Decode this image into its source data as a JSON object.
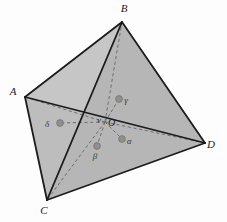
{
  "figure": {
    "canvas": {
      "width": 227,
      "height": 222,
      "background": "#fdfdfd"
    },
    "style": {
      "face_light": "#d2d2d2",
      "face_mid": "#c6c6c6",
      "face_dark": "#bdbdbd",
      "face_darkest": "#b6b6b6",
      "edge_color": "#1c1c1c",
      "dashed_color": "#6e6e6e",
      "marker_color": "#8f8f8f",
      "marker_stroke": "#707070",
      "label_color": "#1a1a1a"
    },
    "vertices": [
      {
        "id": "B",
        "label": "B",
        "x": 122,
        "y": 22,
        "label_x": 124,
        "label_y": 12,
        "role": "apex"
      },
      {
        "id": "A",
        "label": "A",
        "x": 25,
        "y": 97,
        "label_x": 13,
        "label_y": 95,
        "role": "left"
      },
      {
        "id": "C",
        "label": "C",
        "x": 47,
        "y": 200,
        "label_x": 44,
        "label_y": 214,
        "role": "bottom"
      },
      {
        "id": "D",
        "label": "D",
        "x": 205,
        "y": 143,
        "label_x": 211,
        "label_y": 148,
        "role": "right"
      }
    ],
    "interior_point": {
      "id": "O",
      "label": "O",
      "x": 105,
      "y": 122,
      "label_x": 108,
      "label_y": 126,
      "tick_label": "ν",
      "tick_label_x": 99,
      "tick_label_y": 123
    },
    "face_centers": [
      {
        "id": "alpha",
        "label": "α",
        "x": 122,
        "y": 139,
        "label_x": 129,
        "label_y": 144,
        "face": "OBCD"
      },
      {
        "id": "beta",
        "label": "β",
        "x": 97,
        "y": 146,
        "label_x": 95,
        "label_y": 159,
        "face": "OACD"
      },
      {
        "id": "gamma",
        "label": "γ",
        "x": 119,
        "y": 99,
        "label_x": 126,
        "label_y": 103,
        "face": "OABD"
      },
      {
        "id": "delta",
        "label": "δ",
        "x": 60,
        "y": 123,
        "label_x": 47,
        "label_y": 127,
        "face": "OABC"
      }
    ],
    "solid_edges": [
      {
        "id": "edge-AB",
        "from": "A",
        "to": "B"
      },
      {
        "id": "edge-AC",
        "from": "A",
        "to": "C"
      },
      {
        "id": "edge-AD",
        "from": "A",
        "to": "D"
      },
      {
        "id": "edge-BC",
        "from": "B",
        "to": "C"
      },
      {
        "id": "edge-BD",
        "from": "B",
        "to": "D"
      },
      {
        "id": "edge-CD",
        "from": "C",
        "to": "D"
      }
    ],
    "dashed_segments": [
      {
        "id": "seg-OA",
        "from": "O",
        "to": "A"
      },
      {
        "id": "seg-OB",
        "from": "O",
        "to": "B"
      },
      {
        "id": "seg-OC",
        "from": "O",
        "to": "C"
      },
      {
        "id": "seg-OD",
        "from": "O",
        "to": "D"
      },
      {
        "id": "seg-O-alpha",
        "from": "O",
        "to": "alpha"
      },
      {
        "id": "seg-O-beta",
        "from": "O",
        "to": "beta"
      },
      {
        "id": "seg-O-gamma",
        "from": "O",
        "to": "gamma"
      },
      {
        "id": "seg-O-delta",
        "from": "O",
        "to": "delta"
      }
    ],
    "faces": [
      {
        "id": "face-ABC",
        "shade": "face_light",
        "points": "25,97 122,22 47,200"
      },
      {
        "id": "face-ABD",
        "shade": "face_mid",
        "points": "25,97 122,22 205,143"
      },
      {
        "id": "face-ACD",
        "shade": "face_dark",
        "points": "25,97 47,200 205,143"
      },
      {
        "id": "face-BCD",
        "shade": "face_darkest",
        "points": "122,22 47,200 205,143"
      }
    ]
  }
}
